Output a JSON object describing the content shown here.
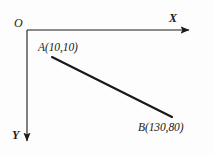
{
  "figure": {
    "background_color": "#fdfdfd",
    "ink_color": "#1a1a1a",
    "width": 213,
    "height": 155
  },
  "axes": {
    "origin_label": "O",
    "origin": {
      "x": 27,
      "y": 30
    },
    "x_axis": {
      "label": "X",
      "direction": "right",
      "start": {
        "x": 27,
        "y": 30
      },
      "end": {
        "x": 192,
        "y": 30
      },
      "arrowhead": true,
      "stroke_width": 1.1
    },
    "y_axis": {
      "label": "Y",
      "direction": "down",
      "start": {
        "x": 27,
        "y": 30
      },
      "end": {
        "x": 27,
        "y": 144
      },
      "arrowhead": true,
      "stroke_width": 1.1
    }
  },
  "segment": {
    "name": "line-ab",
    "stroke_width": 2.1,
    "from": {
      "x": 52,
      "y": 57
    },
    "to": {
      "x": 172,
      "y": 117
    }
  },
  "points": [
    {
      "id": "A",
      "label": "A(10,10)",
      "coordinates": {
        "x": 10,
        "y": 10
      },
      "marker": {
        "x": 52,
        "y": 57
      },
      "label_position": "above-right"
    },
    {
      "id": "B",
      "label": "B(130,80)",
      "coordinates": {
        "x": 130,
        "y": 80
      },
      "marker": {
        "x": 172,
        "y": 117
      },
      "label_position": "below-left"
    }
  ]
}
